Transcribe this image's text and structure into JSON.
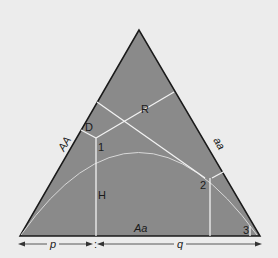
{
  "diagram": {
    "type": "de Finetti ternary diagram",
    "colors": {
      "background": "#ececec",
      "triangle_fill": "#8a8a8a",
      "triangle_stroke": "#1a1a1a",
      "lines": "#f2f2f2",
      "text": "#1a1a1a"
    },
    "side_labels": {
      "left": "AA",
      "right": "aa",
      "bottom": "Aa"
    },
    "region_labels": {
      "R": "R",
      "D": "D",
      "H": "H"
    },
    "point_labels": [
      "1",
      "2",
      "3"
    ],
    "axis": {
      "p_label": "p",
      "q_label": "q",
      "separator": ":"
    }
  }
}
